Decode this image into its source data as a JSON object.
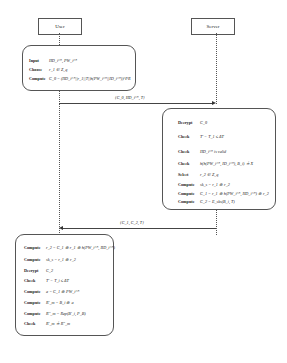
{
  "actors": {
    "user": "User",
    "server": "Server"
  },
  "user_box_1": {
    "rows": [
      {
        "k": "Input",
        "v": "IID_i^*, PW_i^*"
      },
      {
        "k": "Choose",
        "v": "r_1 ∈ Z_q"
      },
      {
        "k": "Compute",
        "v": "C_0 = (IID_i^*||r_1||T||h(PW_i^*||ID_i^*))^PR"
      }
    ]
  },
  "messages": {
    "m1": "{C_0, IID_i^*, T}",
    "m2": "{C_1, C_2, T}"
  },
  "server_box": {
    "rows": [
      {
        "k": "Decrypt",
        "v": "C_0"
      },
      {
        "k": "Check",
        "v": "T' − T_1 ≤ ΔT"
      },
      {
        "k": "Check",
        "v": "IID_i^*  is valid"
      },
      {
        "k": "Check",
        "v": "h(h(PW_i^*, ID_i^*), B_i) ≟ X"
      },
      {
        "k": "Select",
        "v": "r_2 ∈ Z_q"
      },
      {
        "k": "Compute",
        "v": "sk_s = r_1 ⊕ r_2"
      },
      {
        "k": "Compute",
        "v": "C_1 = r_1 ⊕ h(PW_i^*, IID_i^*) ⊕ r_2"
      },
      {
        "k": "Compute",
        "v": "C_2 = E_sks(B_i, T)"
      }
    ]
  },
  "user_box_2": {
    "rows": [
      {
        "k": "Compute",
        "v": "r_2 = C_1 ⊕ r_1 ⊕ h(PW_i^*, IID_i^*)"
      },
      {
        "k": "Compute",
        "v": "sk_s = r_1 ⊕ r_2"
      },
      {
        "k": "Decrypt",
        "v": "C_2"
      },
      {
        "k": "Check",
        "v": "T' − T_i ≤ ΔT"
      },
      {
        "k": "Compute",
        "v": "a = C_1 ⊕ PW_i^*"
      },
      {
        "k": "Compute",
        "v": "R'_m = B_i ⊕ a"
      },
      {
        "k": "Compute",
        "v": "R''_m = Rep(B'_i, P_B)"
      },
      {
        "k": "Check",
        "v": "R'_m ≟ R''_m"
      }
    ]
  }
}
